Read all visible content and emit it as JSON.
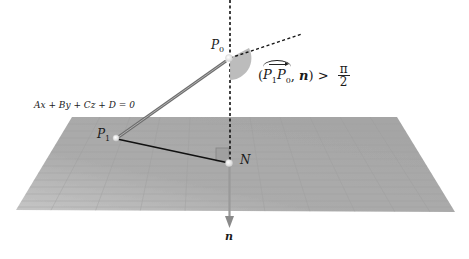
{
  "diagram": {
    "plane_equation": "Ax + By + Cz + D = 0",
    "points": {
      "P0": {
        "base": "P",
        "sub": "0"
      },
      "P1": {
        "base": "P",
        "sub": "1"
      },
      "N": {
        "label": "N"
      }
    },
    "normal_vector_label": "n",
    "angle_condition": {
      "open_paren": "(",
      "vec_base1": "P",
      "vec_sub1": "1",
      "vec_base2": "P",
      "vec_sub2": "0",
      "comma": ", ",
      "normal": "n",
      "close_paren": ")",
      "relation": " > ",
      "frac_num": "π",
      "frac_den": "2"
    },
    "colors": {
      "plane": "#a9a9a9",
      "plane_light": "#c4c4c4",
      "grid": "#9a9a9a",
      "segment_P1P0": "#7a7a7a",
      "segment_P1N": "#111111",
      "angle_wedge": "#b5b5b5",
      "dashed": "#111111",
      "normal_arrow": "#8c8c8c"
    }
  }
}
